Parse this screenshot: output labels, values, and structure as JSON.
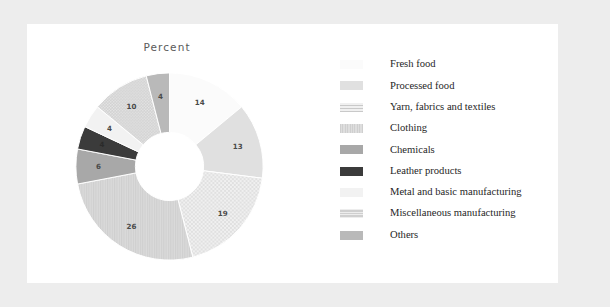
{
  "chart_data": {
    "type": "pie",
    "variant": "donut",
    "title": "Percent",
    "xlabel": "",
    "ylabel": "",
    "legend_position": "right",
    "grid": false,
    "categories": [
      "Fresh food",
      "Processed food",
      "Yarn, fabrics and textiles",
      "Clothing",
      "Chemicals",
      "Leather products",
      "Metal and basic manufacturing",
      "Miscellaneous manufacturing",
      "Others"
    ],
    "values": [
      14,
      13,
      19,
      26,
      6,
      4,
      4,
      10,
      4
    ],
    "slice_labels": [
      "14",
      "13",
      "19",
      "26",
      "6",
      "4",
      "4",
      "10",
      "4"
    ],
    "colors": [
      "#fbfbfb",
      "#e0e0e0",
      "#ececec",
      "#d5d5d5",
      "#a8a8a8",
      "#3b3b3b",
      "#f2f2f2",
      "#c7c7c7",
      "#b9b9b9"
    ],
    "patterns": [
      "solid",
      "solid",
      "dots",
      "vlines",
      "solid",
      "solid",
      "solid",
      "dots-dense",
      "solid"
    ]
  },
  "chart": {
    "title": "Percent"
  },
  "legend": {
    "items": [
      {
        "label": "Fresh food",
        "value": "14"
      },
      {
        "label": "Processed food",
        "value": "13"
      },
      {
        "label": "Yarn, fabrics and textiles",
        "value": "19"
      },
      {
        "label": "Clothing",
        "value": "26"
      },
      {
        "label": "Chemicals",
        "value": "6"
      },
      {
        "label": "Leather products",
        "value": "4"
      },
      {
        "label": "Metal and basic manufacturing",
        "value": "4"
      },
      {
        "label": "Miscellaneous manufacturing",
        "value": "10"
      },
      {
        "label": "Others",
        "value": "4"
      }
    ]
  },
  "theme": {
    "page_background": "#ededed",
    "panel_background": "#ffffff",
    "text_color": "#262626",
    "title_color": "#5a5a5a"
  }
}
